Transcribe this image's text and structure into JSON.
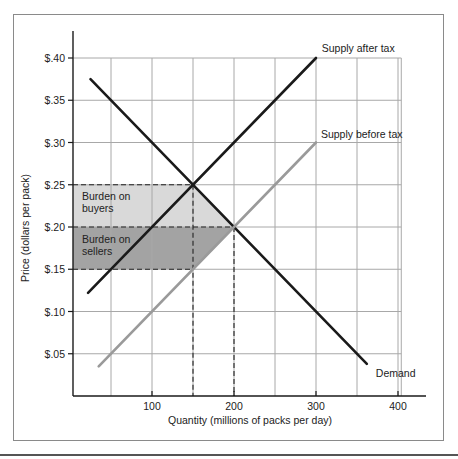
{
  "chart_data": {
    "type": "line",
    "title": "",
    "xlabel": "Quantity (millions of packs per day)",
    "ylabel": "Price (dollars per pack)",
    "xlim": [
      0,
      425
    ],
    "ylim": [
      0,
      0.42
    ],
    "grid": true,
    "x_ticks": [
      100,
      200,
      300,
      400
    ],
    "x_tick_labels": [
      "100",
      "200",
      "300",
      "400"
    ],
    "x_grid": [
      50,
      100,
      150,
      200,
      250,
      300,
      350,
      400
    ],
    "y_ticks": [
      0.05,
      0.1,
      0.15,
      0.2,
      0.25,
      0.3,
      0.35,
      0.4
    ],
    "y_tick_labels": [
      "$.05",
      "$.10",
      "$.15",
      "$.20",
      "$.25",
      "$.30",
      "$.35",
      "$.40"
    ],
    "series": [
      {
        "name": "Demand",
        "color": "#1a1a1a",
        "width": 2.6,
        "x": [
          25,
          362
        ],
        "y": [
          0.375,
          0.038
        ],
        "label": "Demand",
        "label_pos": [
          373,
          0.023
        ]
      },
      {
        "name": "Supply after tax",
        "color": "#1a1a1a",
        "width": 2.6,
        "x": [
          22,
          300
        ],
        "y": [
          0.122,
          0.4
        ],
        "label": "Supply after tax",
        "label_pos": [
          307,
          0.407
        ]
      },
      {
        "name": "Supply before tax",
        "color": "#9a9a9a",
        "width": 2.6,
        "x": [
          35,
          300
        ],
        "y": [
          0.035,
          0.3
        ],
        "label": "Supply before tax",
        "label_pos": [
          306,
          0.305
        ]
      }
    ],
    "shaded_regions": [
      {
        "name": "Burden on buyers",
        "label_lines": [
          "Burden on",
          "buyers"
        ],
        "color": "#d9d9d9",
        "polygon": [
          [
            0,
            0.25
          ],
          [
            150,
            0.25
          ],
          [
            200,
            0.2
          ],
          [
            0,
            0.2
          ]
        ],
        "label_pos": [
          12,
          0.228
        ]
      },
      {
        "name": "Burden on sellers",
        "label_lines": [
          "Burden on",
          "sellers"
        ],
        "color": "#a3a3a3",
        "polygon": [
          [
            0,
            0.2
          ],
          [
            200,
            0.2
          ],
          [
            150,
            0.15
          ],
          [
            0,
            0.15
          ]
        ],
        "label_pos": [
          12,
          0.178
        ]
      }
    ],
    "reference_lines": {
      "horizontal": [
        {
          "y": 0.25,
          "x_to": 150
        },
        {
          "y": 0.2,
          "x_to": 200
        },
        {
          "y": 0.15,
          "x_to": 150
        }
      ],
      "vertical": [
        {
          "x": 150,
          "y_to": 0.25
        },
        {
          "x": 200,
          "y_to": 0.2
        }
      ]
    },
    "equilibria": {
      "before_tax": {
        "quantity": 200,
        "price": 0.2
      },
      "after_tax": {
        "quantity": 150,
        "buyer_price": 0.25,
        "seller_price": 0.15
      },
      "tax_per_pack": 0.1
    }
  },
  "colors": {
    "axis": "#1a1a1a",
    "grid": "#a8a8a8",
    "dash": "#222222"
  }
}
